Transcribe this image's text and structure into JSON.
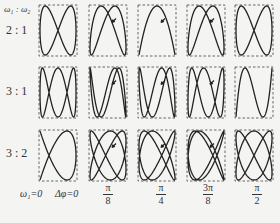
{
  "header": {
    "ratio_label": "ω₁ : ω₂"
  },
  "rows": [
    {
      "label": "2 : 1",
      "a": 2,
      "b": 1
    },
    {
      "label": "3 : 1",
      "a": 3,
      "b": 1
    },
    {
      "label": "3 : 2",
      "a": 3,
      "b": 2
    }
  ],
  "footer": {
    "omega_label": "ω₁=0",
    "phase_label": "Δφ=0",
    "phases": [
      {
        "num": "π",
        "den": "8",
        "value": 0.3927
      },
      {
        "num": "π",
        "den": "4",
        "value": 0.7854
      },
      {
        "num": "3π",
        "den": "8",
        "value": 1.1781
      },
      {
        "num": "π",
        "den": "2",
        "value": 1.5708
      }
    ]
  },
  "layout": {
    "col_x": [
      39,
      89,
      138,
      187,
      235
    ],
    "row_y": [
      5,
      67,
      130
    ],
    "box_w": 38,
    "box_h": 51
  },
  "colors": {
    "curve": "#222222",
    "box": "#444444",
    "background": "#f4f4f2"
  }
}
